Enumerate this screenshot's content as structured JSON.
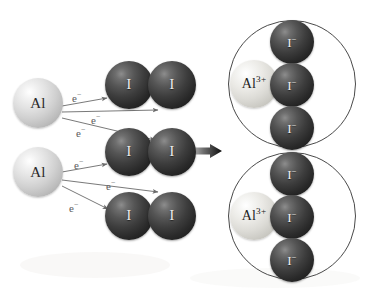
{
  "figure": {
    "caption": "Formation of aluminum iodide from aluminum atoms and iodine molecules",
    "background_color": "#ffffff"
  },
  "colors": {
    "aluminum_sphere": "#d8d8d8",
    "aluminum_ion_sphere": "#e3e2dd",
    "iodine_sphere": "#2c2c2c",
    "arrow_electron": "#6a6a6a",
    "arrow_reaction": "#111111",
    "ring_outline": "#4a4a4a",
    "label_dark": "#2a2a2a",
    "label_light": "#f0f0f0"
  },
  "reactants": {
    "metal_atoms": [
      {
        "id": "al-atom-1",
        "label": "Al",
        "cx": 38,
        "cy": 103,
        "r": 25
      },
      {
        "id": "al-atom-2",
        "label": "Al",
        "cx": 38,
        "cy": 172,
        "r": 25
      }
    ],
    "halogen_molecules": [
      {
        "id": "i2-molecule-1",
        "atoms": [
          {
            "label": "I",
            "cx": 129,
            "cy": 85,
            "r": 24
          },
          {
            "label": "I",
            "cx": 172,
            "cy": 85,
            "r": 24
          }
        ]
      },
      {
        "id": "i2-molecule-2",
        "atoms": [
          {
            "label": "I",
            "cx": 129,
            "cy": 152,
            "r": 24
          },
          {
            "label": "I",
            "cx": 172,
            "cy": 152,
            "r": 24
          }
        ]
      },
      {
        "id": "i2-molecule-3",
        "atoms": [
          {
            "label": "I",
            "cx": 129,
            "cy": 216,
            "r": 24
          },
          {
            "label": "I",
            "cx": 172,
            "cy": 216,
            "r": 24
          }
        ]
      }
    ]
  },
  "electron_transfers": [
    {
      "id": "e-transfer-1",
      "label": "e",
      "charge": "−",
      "from": "al-atom-1",
      "to": "i2-molecule-1",
      "x1": 62,
      "y1": 106,
      "x2": 107,
      "y2": 98,
      "label_x": 72,
      "label_y": 93
    },
    {
      "id": "e-transfer-2",
      "label": "e",
      "charge": "−",
      "from": "al-atom-1",
      "to": "i2-molecule-1",
      "x1": 62,
      "y1": 112,
      "x2": 158,
      "y2": 110,
      "label_x": 91,
      "label_y": 115
    },
    {
      "id": "e-transfer-3",
      "label": "e",
      "charge": "−",
      "from": "al-atom-1",
      "to": "i2-molecule-2",
      "x1": 62,
      "y1": 118,
      "x2": 155,
      "y2": 140,
      "label_x": 76,
      "label_y": 128
    },
    {
      "id": "e-transfer-4",
      "label": "e",
      "charge": "−",
      "from": "al-atom-2",
      "to": "i2-molecule-2",
      "x1": 62,
      "y1": 172,
      "x2": 107,
      "y2": 164,
      "label_x": 74,
      "label_y": 160
    },
    {
      "id": "e-transfer-5",
      "label": "e",
      "charge": "−",
      "from": "al-atom-2",
      "to": "i2-molecule-3",
      "x1": 62,
      "y1": 180,
      "x2": 158,
      "y2": 192,
      "label_x": 106,
      "label_y": 181
    },
    {
      "id": "e-transfer-6",
      "label": "e",
      "charge": "−",
      "from": "al-atom-2",
      "to": "i2-molecule-3",
      "x1": 62,
      "y1": 186,
      "x2": 108,
      "y2": 209,
      "label_x": 69,
      "label_y": 203
    }
  ],
  "reaction_arrow": {
    "id": "reaction-arrow",
    "x1": 188,
    "y1": 151,
    "x2": 222,
    "y2": 151
  },
  "products": [
    {
      "id": "formula-unit-1",
      "ring": {
        "cx": 292,
        "cy": 84,
        "r": 64
      },
      "cation": {
        "label": "Al",
        "charge": "3+",
        "cx": 254,
        "cy": 84,
        "r": 24
      },
      "anions": [
        {
          "label": "I",
          "charge": "−",
          "cx": 292,
          "cy": 42,
          "r": 22
        },
        {
          "label": "I",
          "charge": "−",
          "cx": 292,
          "cy": 85,
          "r": 22
        },
        {
          "label": "I",
          "charge": "−",
          "cx": 292,
          "cy": 128,
          "r": 22
        }
      ]
    },
    {
      "id": "formula-unit-2",
      "ring": {
        "cx": 292,
        "cy": 216,
        "r": 64
      },
      "cation": {
        "label": "Al",
        "charge": "3+",
        "cx": 254,
        "cy": 216,
        "r": 24
      },
      "anions": [
        {
          "label": "I",
          "charge": "−",
          "cx": 292,
          "cy": 174,
          "r": 22
        },
        {
          "label": "I",
          "charge": "−",
          "cx": 292,
          "cy": 217,
          "r": 22
        },
        {
          "label": "I",
          "charge": "−",
          "cx": 292,
          "cy": 260,
          "r": 22
        }
      ]
    }
  ],
  "text": {
    "al_label": "Al",
    "al_ion_label": "Al",
    "al_ion_charge": "3+",
    "i_label": "I",
    "i_ion_label": "I",
    "i_ion_charge": "−",
    "electron_label": "e",
    "electron_charge": "−"
  }
}
